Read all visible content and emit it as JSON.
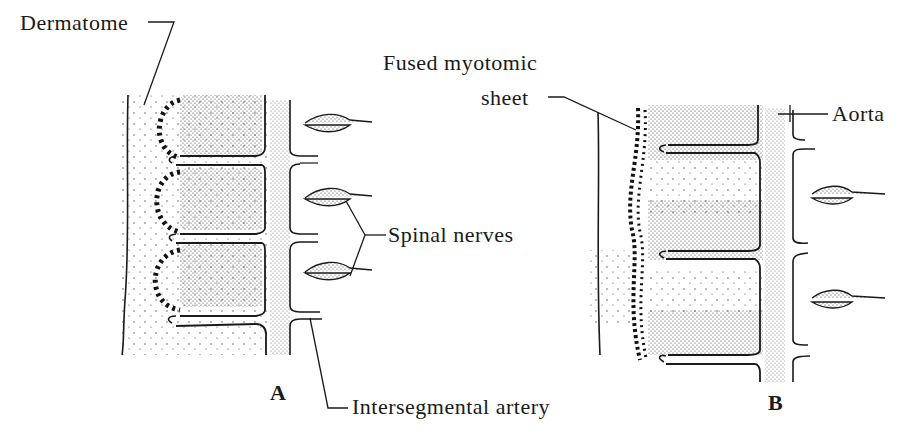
{
  "figure": {
    "panels": [
      {
        "id": "A",
        "label": "A"
      },
      {
        "id": "B",
        "label": "B"
      }
    ],
    "labels": {
      "dermatome": "Dermatome",
      "fused_myotomic_sheet_line1": "Fused myotomic",
      "fused_myotomic_sheet_line2": "sheet",
      "aorta": "Aorta",
      "spinal_nerves": "Spinal nerves",
      "intersegmental_artery": "Intersegmental artery"
    },
    "colors": {
      "ink": "#1a1a1a",
      "background": "#ffffff",
      "stipple": "#333333"
    }
  }
}
